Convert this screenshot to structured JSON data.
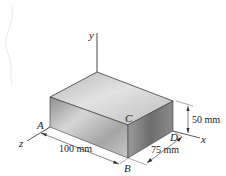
{
  "figure": {
    "type": "3D rectangular block with coordinate axes and dimensions",
    "axes": {
      "x_label": "x",
      "y_label": "y",
      "z_label": "z"
    },
    "points": {
      "A": "A",
      "B": "B",
      "C": "C",
      "D": "D"
    },
    "dimensions": {
      "length": "100 mm",
      "width": "75 mm",
      "height": "50 mm"
    },
    "colors": {
      "block_top": "#c9c9c9",
      "block_front": "#a8a8a8",
      "block_side": "#8d8d8d",
      "edge": "#3a3a3a",
      "line": "#333333"
    }
  }
}
